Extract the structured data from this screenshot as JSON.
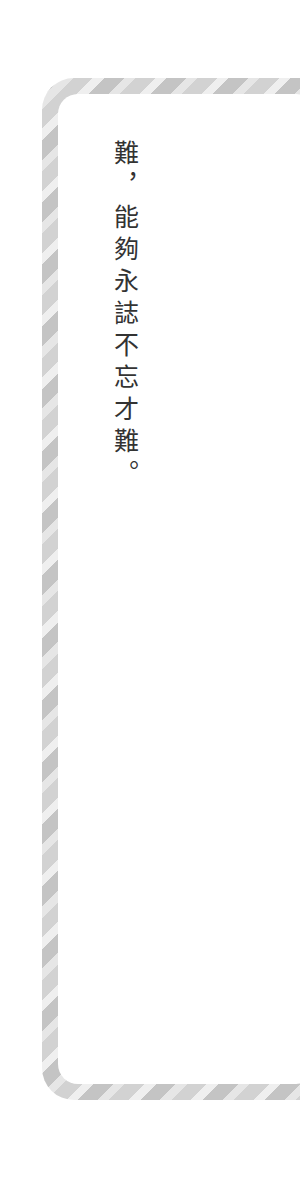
{
  "page": {
    "text": "難，能夠永誌不忘才難。",
    "colors": {
      "background": "#ffffff",
      "frame_dark": "#c4c4c4",
      "frame_light": "#e6e6e6",
      "text": "#333333"
    }
  }
}
